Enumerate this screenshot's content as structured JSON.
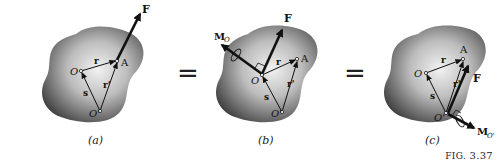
{
  "figure": {
    "label": "FIG. 3.37",
    "label_prefix": "FIG.",
    "label_number": "3.37"
  },
  "equals_signs": [
    "=",
    "="
  ],
  "panels": [
    {
      "caption": "(a)",
      "labels": {
        "force": "F",
        "point_A": "A",
        "point_O": "O",
        "point_O_prime": "O'",
        "vector_r": "r",
        "vector_r_prime": "r'",
        "vector_s": "s"
      }
    },
    {
      "caption": "(b)",
      "labels": {
        "force": "F",
        "moment": "M",
        "moment_sub": "O",
        "point_A": "A",
        "point_O": "O",
        "point_O_prime": "O'",
        "vector_r": "r",
        "vector_r_prime": "r'",
        "vector_s": "s"
      }
    },
    {
      "caption": "(c)",
      "labels": {
        "force": "F",
        "moment": "M",
        "moment_sub": "O'",
        "point_A": "A",
        "point_O": "O",
        "point_O_prime": "O'",
        "vector_r": "r",
        "vector_r_prime": "r'",
        "vector_s": "s"
      }
    }
  ],
  "colors": {
    "body_dark": "#3a3a3a",
    "body_light": "#e8e8e8",
    "ink": "#111111"
  }
}
